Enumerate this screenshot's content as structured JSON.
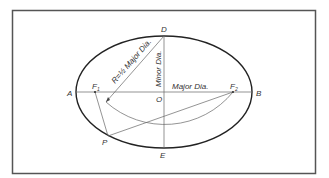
{
  "diagram": {
    "points": {
      "A": "A",
      "B": "B",
      "D": "D",
      "E": "E",
      "O": "O",
      "F1": "F",
      "F1_sub": "1",
      "F2": "F",
      "F2_sub": "2",
      "P": "P"
    },
    "labels": {
      "major_dia": "Major Dia.",
      "minor_dia": "Minor Dia.",
      "radius": "R=½ Major Dia."
    },
    "colors": {
      "frame": "#555555",
      "ellipse": "#222222",
      "lines": "#666666",
      "text": "#333333"
    }
  }
}
